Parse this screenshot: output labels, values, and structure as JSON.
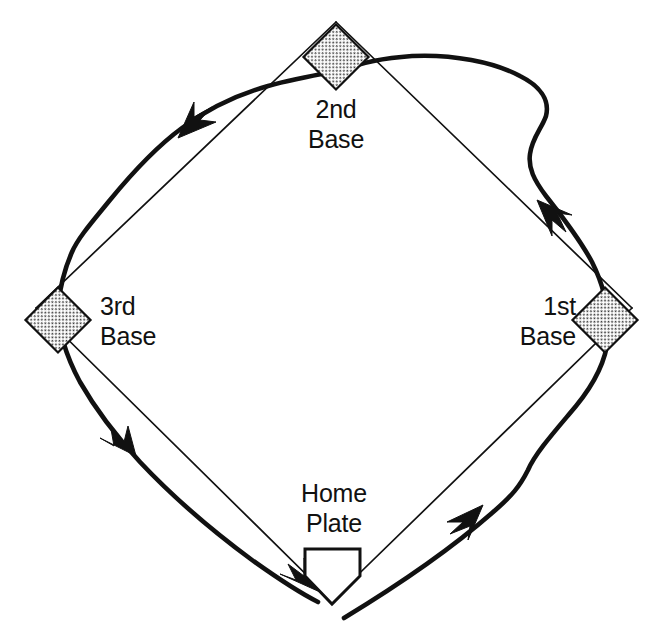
{
  "diagram": {
    "type": "line-diagram",
    "background_color": "#ffffff",
    "ink_color": "#111111",
    "base_fill_color": "#e8e8e8",
    "canvas": {
      "width": 657,
      "height": 643
    }
  },
  "labels": {
    "second_base": {
      "line1": "2nd",
      "line2": "Base"
    },
    "third_base": {
      "line1": "3rd",
      "line2": "Base"
    },
    "first_base": {
      "line1": "1st",
      "line2": "Base"
    },
    "home_plate": {
      "line1": "Home",
      "line2": "Plate"
    }
  },
  "bases": [
    {
      "name": "home-plate",
      "shape": "pentagon",
      "fill": "#ffffff",
      "center_x": 332,
      "center_y": 575
    },
    {
      "name": "first-base",
      "shape": "diamond",
      "fill": "#e8e8e8",
      "center_x": 605,
      "center_y": 320
    },
    {
      "name": "second-base",
      "shape": "diamond",
      "fill": "#e8e8e8",
      "center_x": 336,
      "center_y": 57
    },
    {
      "name": "third-base",
      "shape": "diamond",
      "fill": "#e8e8e8",
      "center_x": 58,
      "center_y": 320
    }
  ],
  "infield": {
    "description": "Thin square baselines connecting home plate, 1st, 2nd and 3rd base",
    "corners": [
      {
        "base": "home-plate",
        "x": 332,
        "y": 600
      },
      {
        "base": "first-base",
        "x": 612,
        "y": 317
      },
      {
        "base": "second-base",
        "x": 336,
        "y": 36
      },
      {
        "base": "third-base",
        "x": 52,
        "y": 317
      }
    ]
  },
  "running_path": {
    "description": "Heavy curved base-running path with rounded turns, swinging wide outside each base",
    "direction": "counter-clockwise",
    "stroke_width": 4.6,
    "segments": [
      {
        "from": "home-plate",
        "to": "first-base",
        "arrow_at_x": 460,
        "arrow_at_y": 523,
        "arrow_direction": "up-right"
      },
      {
        "from": "first-base",
        "to": "second-base",
        "arrow_at_x": 548,
        "arrow_at_y": 212,
        "arrow_direction": "up-left"
      },
      {
        "from": "second-base",
        "to": "third-base",
        "arrow_at_x": 190,
        "arrow_at_y": 132,
        "arrow_direction": "down-left"
      },
      {
        "from": "third-base",
        "to": "home-plate",
        "arrow_at_x": 126,
        "arrow_at_y": 430,
        "arrow_direction": "down-right"
      },
      {
        "from": "third-base",
        "to": "home-plate-final",
        "arrow_at_x": 310,
        "arrow_at_y": 578,
        "arrow_direction": "down-right"
      }
    ],
    "arrow_count": 5
  }
}
